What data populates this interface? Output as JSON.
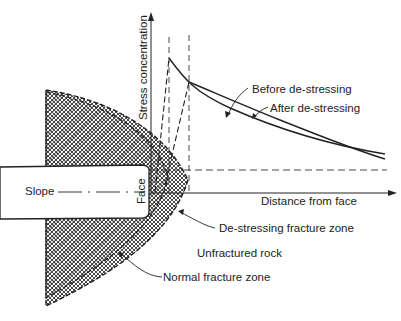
{
  "diagram": {
    "axes": {
      "y_label": "Stress concentration",
      "x_label": "Distance from face"
    },
    "curves": [
      {
        "name": "before",
        "label": "Before de-stressing"
      },
      {
        "name": "after",
        "label": "After de-stressing"
      }
    ],
    "labels": {
      "slope": "Slope",
      "face": "Face",
      "destressing_zone": "De-stressing fracture zone",
      "unfractured": "Unfractured rock",
      "normal_zone": "Normal fracture zone"
    },
    "colors": {
      "line": "#222222",
      "background": "#ffffff"
    }
  }
}
